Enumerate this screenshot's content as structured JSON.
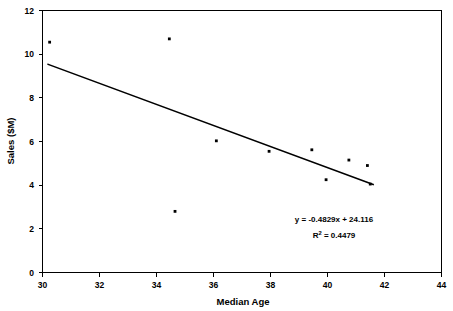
{
  "chart_data": {
    "type": "scatter",
    "title": "",
    "xlabel": "Median Age",
    "ylabel": "Sales ($M)",
    "xlim": [
      30,
      44
    ],
    "ylim": [
      0,
      12
    ],
    "xticks": [
      30,
      32,
      34,
      36,
      38,
      40,
      42,
      44
    ],
    "yticks": [
      0,
      2,
      4,
      6,
      8,
      10,
      12
    ],
    "grid": false,
    "legend": null,
    "series": [
      {
        "name": "Sales vs Median Age",
        "marker": "square-dot",
        "color": "#000000",
        "points": [
          {
            "x": 30.25,
            "y": 10.55
          },
          {
            "x": 34.45,
            "y": 10.7
          },
          {
            "x": 34.65,
            "y": 2.8
          },
          {
            "x": 36.1,
            "y": 6.03
          },
          {
            "x": 37.95,
            "y": 5.55
          },
          {
            "x": 39.45,
            "y": 5.62
          },
          {
            "x": 39.95,
            "y": 4.25
          },
          {
            "x": 40.75,
            "y": 5.15
          },
          {
            "x": 41.4,
            "y": 4.9
          },
          {
            "x": 41.5,
            "y": 4.05
          }
        ]
      }
    ],
    "trendline": {
      "slope": -0.4829,
      "intercept": 24.116,
      "x_start": 30.2,
      "x_end": 41.6,
      "color": "#000000"
    },
    "annotations": {
      "equation": "y = -0.4829x + 24.116",
      "r_squared_label": "R",
      "r_squared_exponent": "2",
      "r_squared_value": " = 0.4479"
    }
  },
  "axes": {
    "x_tick_labels": [
      "30",
      "32",
      "34",
      "36",
      "38",
      "40",
      "42",
      "44"
    ],
    "y_tick_labels": [
      "0",
      "2",
      "4",
      "6",
      "8",
      "10",
      "12"
    ],
    "x_axis_title": "Median Age",
    "y_axis_title": "Sales ($M)"
  },
  "colors": {
    "background": "#ffffff",
    "foreground": "#000000",
    "marker": "#000000",
    "trendline": "#000000"
  }
}
